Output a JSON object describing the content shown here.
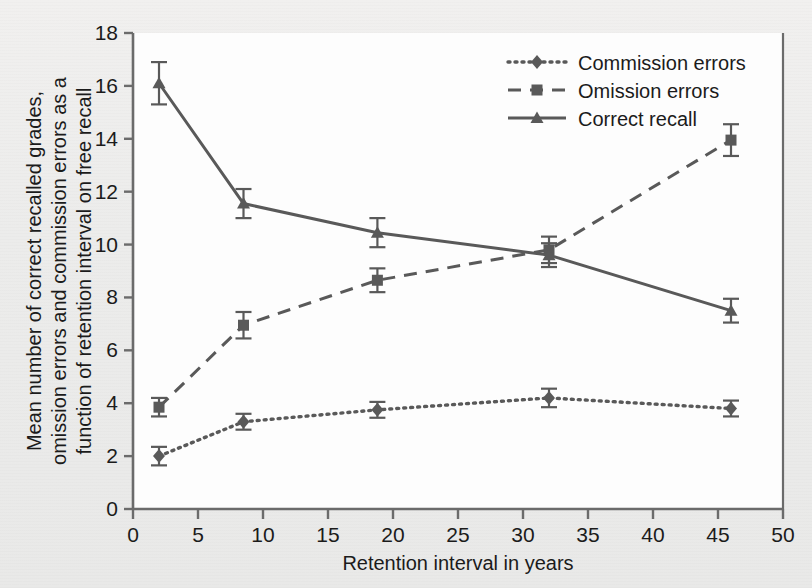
{
  "chart_data": {
    "type": "line",
    "title": "",
    "xlabel": "Retention interval in years",
    "ylabel": "Mean number of correct recalled grades, omission errors and commission errors as a function of retention interval on free recall",
    "ylabel_lines": [
      "Mean number of correct recalled grades,",
      "omission errors and commission errors as a",
      "function of retention interval on free recall"
    ],
    "xlim": [
      0,
      50
    ],
    "ylim": [
      0,
      18
    ],
    "xticks": [
      0,
      5,
      10,
      15,
      20,
      25,
      30,
      35,
      40,
      45,
      50
    ],
    "yticks": [
      0,
      2,
      4,
      6,
      8,
      10,
      12,
      14,
      16,
      18
    ],
    "xtick_labels": [
      "0",
      "5",
      "10",
      "15",
      "20",
      "25",
      "30",
      "35",
      "40",
      "45",
      "50"
    ],
    "ytick_labels": [
      "0",
      "2",
      "4",
      "6",
      "8",
      "10",
      "12",
      "14",
      "16",
      "18"
    ],
    "grid": false,
    "legend_position": "top-right",
    "x": [
      2.0,
      8.5,
      18.8,
      32.0,
      46.0
    ],
    "series": [
      {
        "name": "Commission errors",
        "marker": "diamond",
        "linestyle": "dotted",
        "color": "#595959",
        "values": [
          2.0,
          3.3,
          3.75,
          4.2,
          3.8
        ],
        "errors": [
          0.35,
          0.3,
          0.3,
          0.35,
          0.3
        ]
      },
      {
        "name": "Omission errors",
        "marker": "square",
        "linestyle": "dashed",
        "color": "#595959",
        "values": [
          3.85,
          6.95,
          8.65,
          9.8,
          13.95
        ],
        "errors": [
          0.35,
          0.5,
          0.45,
          0.5,
          0.6
        ]
      },
      {
        "name": "Correct recall",
        "marker": "triangle",
        "linestyle": "solid",
        "color": "#595959",
        "values": [
          16.1,
          11.55,
          10.45,
          9.6,
          7.5
        ],
        "errors": [
          0.8,
          0.55,
          0.55,
          0.45,
          0.45
        ]
      }
    ]
  },
  "legend": {
    "items": [
      {
        "label": "Commission errors",
        "style": "dotted",
        "marker": "diamond"
      },
      {
        "label": "Omission errors",
        "style": "dashed",
        "marker": "square"
      },
      {
        "label": "Correct recall",
        "style": "solid",
        "marker": "triangle"
      }
    ]
  },
  "colors": {
    "ink": "#595959",
    "text": "#1b1b1b",
    "plot_background": "#fdfdfd",
    "page_background": "#ededec"
  }
}
